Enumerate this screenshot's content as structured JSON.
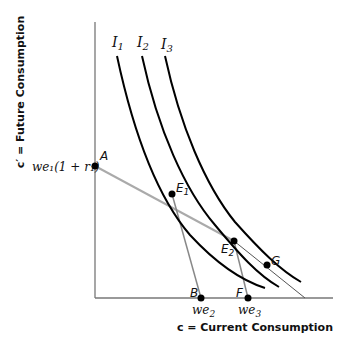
{
  "diagram": {
    "x_axis_label": "c = Current Consumption",
    "y_axis_label": "c′ = Future Consumption",
    "y_intercept_label": "we₁(1 + r₁)",
    "indifference_curves": [
      {
        "label": "I",
        "sub": "1"
      },
      {
        "label": "I",
        "sub": "2"
      },
      {
        "label": "I",
        "sub": "3"
      }
    ],
    "points": [
      {
        "id": "A",
        "label": "A"
      },
      {
        "id": "E1",
        "label": "E",
        "sub": "1"
      },
      {
        "id": "E2",
        "label": "E",
        "sub": "2"
      },
      {
        "id": "G",
        "label": "G"
      },
      {
        "id": "B",
        "label": "B"
      },
      {
        "id": "F",
        "label": "F"
      }
    ],
    "x_tick_labels": [
      {
        "main": "we",
        "sub": "2"
      },
      {
        "main": "we",
        "sub": "3"
      }
    ]
  }
}
